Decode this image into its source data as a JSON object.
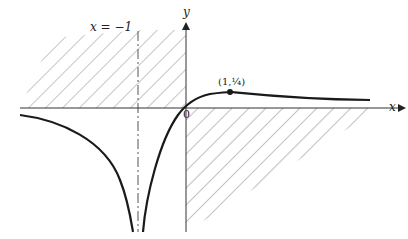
{
  "diagram": {
    "function": "y = x/(x+1)^2",
    "asymptote_label": "x = −1",
    "x_axis_label": "x",
    "y_axis_label": "y",
    "origin_label": "0",
    "max_point_label": "(1,¼)",
    "colors": {
      "curve": "#1a1a1a",
      "axis": "#333333",
      "hatch": "#888888",
      "background": "#ffffff"
    }
  }
}
